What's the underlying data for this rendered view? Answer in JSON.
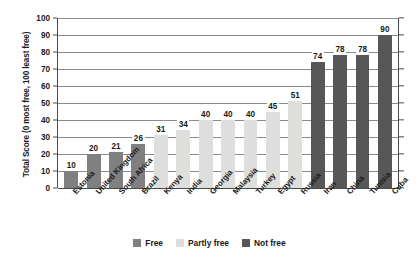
{
  "chart_data": {
    "type": "bar",
    "title": "",
    "xlabel": "",
    "ylabel": "Total Score (0 most free, 100 least free)",
    "ylim": [
      0,
      100
    ],
    "ytick_step": 10,
    "yticks": [
      100,
      90,
      80,
      70,
      60,
      50,
      40,
      30,
      20,
      10,
      0
    ],
    "grid": true,
    "legend_position": "bottom-center",
    "categories": [
      "Estonia",
      "United Kingdom",
      "South Africa",
      "Brazil",
      "Kenya",
      "India",
      "Georgia",
      "Malaysia",
      "Turkey",
      "Egypt",
      "Russia",
      "Iran",
      "China",
      "Tunisia",
      "Cuba"
    ],
    "values": [
      10,
      20,
      21,
      26,
      31,
      34,
      40,
      40,
      40,
      45,
      51,
      74,
      78,
      78,
      90
    ],
    "point_categories": [
      "Free",
      "Free",
      "Free",
      "Free",
      "Partly free",
      "Partly free",
      "Partly free",
      "Partly free",
      "Partly free",
      "Partly free",
      "Partly free",
      "Not free",
      "Not free",
      "Not free",
      "Not free"
    ],
    "series": [
      {
        "name": "Total Score",
        "values": [
          10,
          20,
          21,
          26,
          31,
          34,
          40,
          40,
          40,
          45,
          51,
          74,
          78,
          78,
          90
        ]
      }
    ],
    "legend": [
      {
        "label": "Free",
        "color": "#808080"
      },
      {
        "label": "Partly free",
        "color": "#dededd"
      },
      {
        "label": "Not free",
        "color": "#575757"
      }
    ]
  },
  "colors": {
    "free": "#808080",
    "partly_free": "#dededd",
    "not_free": "#575757",
    "axis": "#4a4a4a",
    "gridline": "#8c8c8c",
    "background": "#ffffff",
    "text": "#1a1a1a"
  }
}
